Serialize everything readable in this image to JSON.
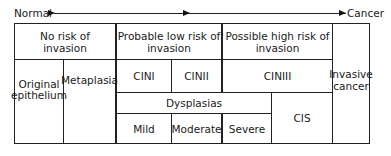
{
  "axis": {
    "start_label": "Normal",
    "end_label": "Cancer"
  },
  "headers": {
    "no_risk": "No risk of invasion",
    "probable_low_risk": "Probable low risk of invasion",
    "possible_high_risk": "Possible high risk of invasion"
  },
  "cin": {
    "cin1": "CINI",
    "cin2": "CINII",
    "cin3": "CINIII"
  },
  "cells": {
    "original_epithelium": "Original epithelium",
    "metaplasia": "Metaplasia",
    "dysplasias": "Dysplasias",
    "mild": "Mild",
    "moderate": "Moderate",
    "severe": "Severe",
    "cis": "CIS",
    "invasive_cancer": "Invasive cancer"
  }
}
